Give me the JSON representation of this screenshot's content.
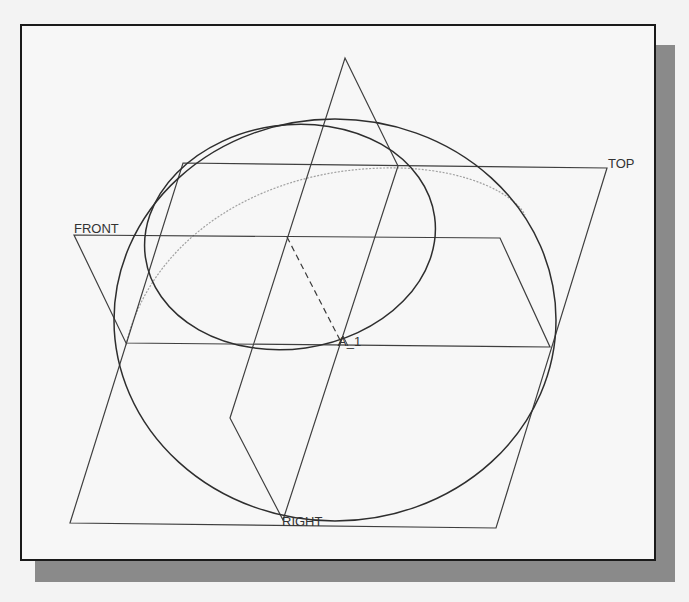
{
  "view": {
    "title": "Default datum planes with revolved ellipse",
    "colors": {
      "background": "#f3f3f3",
      "viewport": "#f7f7f7",
      "frame": "#1a1a1a",
      "shadow": "#8a8a8a",
      "geometry": "#3a3a3a",
      "hidden_geometry": "#9a9a9a"
    }
  },
  "datum_planes": [
    {
      "name": "TOP",
      "label": "TOP"
    },
    {
      "name": "FRONT",
      "label": "FRONT"
    },
    {
      "name": "RIGHT",
      "label": "RIGHT"
    }
  ],
  "datum_axis": {
    "label": "A_1"
  },
  "geometry": {
    "outer_ellipse": {
      "cx": 335,
      "cy": 320,
      "rx": 221,
      "ry": 201
    },
    "inner_ellipse": {
      "cx": 290,
      "cy": 237,
      "rx": 146,
      "ry": 112,
      "rotate": -8
    },
    "hidden_arc": "M 126 345 C 150 240, 260 165, 400 168 C 470 170, 515 195, 525 215"
  }
}
